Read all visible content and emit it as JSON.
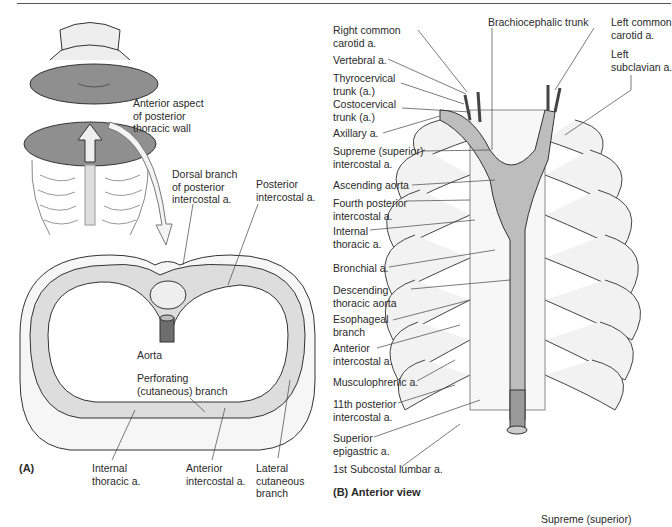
{
  "figure": {
    "panel_a": {
      "tag": "(A)",
      "labels": {
        "anterior_aspect": [
          "Anterior aspect",
          "of posterior",
          "thoracic wall"
        ],
        "dorsal_branch": [
          "Dorsal branch",
          "of posterior",
          "intercostal a."
        ],
        "posterior_intercostal": [
          "Posterior",
          "intercostal a."
        ],
        "aorta": "Aorta",
        "perforating": [
          "Perforating",
          "(cutaneous) branch"
        ],
        "internal_thoracic": [
          "Internal",
          "thoracic a."
        ],
        "anterior_intercostal": [
          "Anterior",
          "intercostal a."
        ],
        "lateral_cutaneous": [
          "Lateral",
          "cutaneous",
          "branch"
        ]
      }
    },
    "panel_b": {
      "tag": "(B) Anterior view",
      "left_labels": [
        [
          "Right  common",
          "carotid a."
        ],
        [
          "Vertebral a."
        ],
        [
          "Thyrocervical",
          "trunk (a.)"
        ],
        [
          "Costocervical",
          "trunk (a.)"
        ],
        [
          "Axillary a."
        ],
        [
          "Supreme (superior)",
          "intercostal a."
        ],
        [
          "Ascending aorta"
        ],
        [
          "Fourth posterior",
          "intercostal a."
        ],
        [
          "Internal",
          "thoracic a."
        ],
        [
          "Bronchial a."
        ],
        [
          "Descending",
          "thoracic aorta"
        ],
        [
          "Esophageal",
          "branch"
        ],
        [
          "Anterior",
          "intercostal a."
        ],
        [
          "Musculophrenic a."
        ],
        [
          "11th posterior",
          "intercostal a."
        ],
        [
          "Superior",
          "epigastric a."
        ],
        [
          "1st Subcostal lumbar a."
        ]
      ],
      "top_labels": {
        "brachiocephalic": "Brachiocephalic trunk",
        "left_common_carotid": [
          "Left common",
          "carotid a."
        ],
        "left_subclavian": [
          "Left",
          "subclavian a."
        ]
      }
    },
    "footer_fragment": "Supreme (superior)",
    "colors": {
      "line": "#333333",
      "fill_gray": "#8f8f8f",
      "light_gray": "#d9d9d9",
      "bone": "#f2f2f2"
    }
  }
}
